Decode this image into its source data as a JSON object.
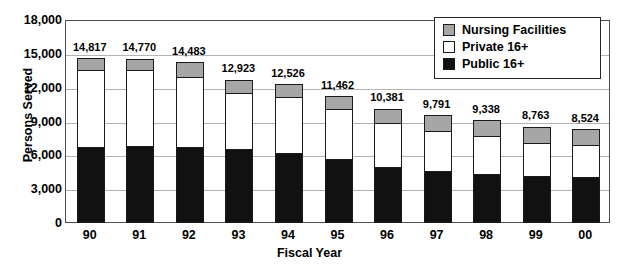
{
  "chart_data": {
    "type": "bar",
    "title": "",
    "xlabel": "Fiscal Year",
    "ylabel": "Persons Served",
    "categories": [
      "90",
      "91",
      "92",
      "93",
      "94",
      "95",
      "96",
      "97",
      "98",
      "99",
      "00"
    ],
    "ylim": [
      0,
      18000
    ],
    "yticks": [
      0,
      3000,
      6000,
      9000,
      12000,
      15000,
      18000
    ],
    "ytick_labels": [
      "0",
      "3,000",
      "6,000",
      "9,000",
      "12,000",
      "15,000",
      "18,000"
    ],
    "grid": true,
    "stacked": true,
    "legend_position": "top-right",
    "totals": [
      14817,
      14770,
      14483,
      12923,
      12526,
      11462,
      10381,
      9791,
      9338,
      8763,
      8524
    ],
    "total_labels": [
      "14,817",
      "14,770",
      "14,483",
      "12,923",
      "12,526",
      "11,462",
      "10,381",
      "9,791",
      "9,338",
      "8,763",
      "8,524"
    ],
    "series": [
      {
        "name": "Public 16+",
        "color": "#111111",
        "values": [
          6750,
          6820,
          6720,
          6550,
          6250,
          5700,
          5000,
          4650,
          4350,
          4150,
          4100
        ]
      },
      {
        "name": "Private 16+",
        "color": "#ffffff",
        "values": [
          6967,
          6850,
          6363,
          5073,
          5026,
          4562,
          3981,
          3641,
          3488,
          3063,
          2924
        ]
      },
      {
        "name": "Nursing Facilities",
        "color": "#a6a6a6",
        "values": [
          1100,
          1100,
          1400,
          1300,
          1250,
          1200,
          1400,
          1500,
          1500,
          1550,
          1500
        ]
      }
    ]
  },
  "legend": {
    "items": [
      {
        "label": "Nursing Facilities",
        "swatch": "nursing"
      },
      {
        "label": "Private 16+",
        "swatch": "private"
      },
      {
        "label": "Public 16+",
        "swatch": "public"
      }
    ]
  }
}
